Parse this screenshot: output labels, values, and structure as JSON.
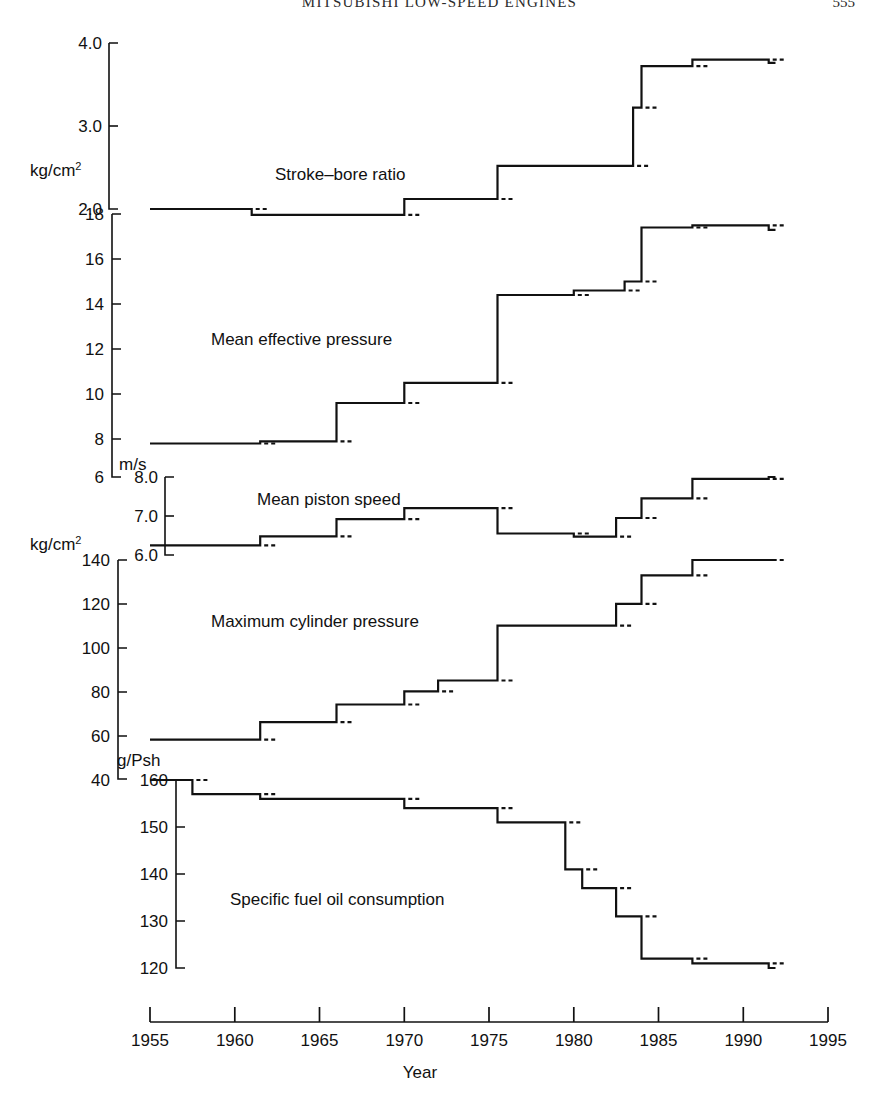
{
  "page": {
    "running_head": "MITSUBISHI LOW-SPEED ENGINES",
    "folio": "555"
  },
  "figure": {
    "x_axis": {
      "label": "Year",
      "ticks": [
        "1955",
        "1960",
        "1965",
        "1970",
        "1975",
        "1980",
        "1985",
        "1990",
        "1995"
      ],
      "min": 1955,
      "max": 1995
    },
    "series_labels": {
      "stroke_bore": "Stroke–bore ratio",
      "mep": "Mean effective pressure",
      "piston_speed": "Mean piston speed",
      "max_pressure": "Maximum cylinder pressure",
      "sfoc": "Specific fuel oil consumption"
    },
    "axis_units": {
      "stroke_bore": "kg/cm",
      "stroke_bore_sup": "2",
      "mep": "kg/cm",
      "mep_sup": "2",
      "piston_speed": "m/s",
      "max_pressure": "kg/cm",
      "max_pressure_sup": "2",
      "sfoc": "g/Psh"
    },
    "axis_ticks": {
      "stroke_bore": [
        "4.0",
        "3.0",
        "2.0"
      ],
      "mep": [
        "18",
        "16",
        "14",
        "12",
        "10",
        "8"
      ],
      "piston_speed": [
        "8.0",
        "7.0",
        "6.0"
      ],
      "max_pressure": [
        "140",
        "120",
        "100",
        "80",
        "60"
      ],
      "sfoc": [
        "160",
        "150",
        "140",
        "130",
        "120"
      ]
    }
  },
  "chart_data": {
    "type": "line",
    "xlabel": "Year",
    "ylabel": "",
    "xlim": [
      1955,
      1995
    ],
    "grid": false,
    "legend": "inline-labels",
    "note": "Five stacked step (staircase) plots sharing one Year axis; each panel has its own y-axis and units.",
    "panels": [
      {
        "name": "Stroke–bore ratio",
        "units": "(ratio)",
        "ylim": [
          2.0,
          4.0
        ],
        "yticks": [
          2.0,
          3.0,
          4.0
        ],
        "step": "post",
        "points": [
          {
            "x": 1955,
            "y": 2.0
          },
          {
            "x": 1961,
            "y": 1.93
          },
          {
            "x": 1970,
            "y": 2.12
          },
          {
            "x": 1975.5,
            "y": 2.52
          },
          {
            "x": 1983.5,
            "y": 3.22
          },
          {
            "x": 1984,
            "y": 3.72
          },
          {
            "x": 1987,
            "y": 3.8
          },
          {
            "x": 1991.5,
            "y": 3.76
          }
        ]
      },
      {
        "name": "Mean effective pressure",
        "units": "kg/cm2",
        "ylim": [
          8,
          18
        ],
        "yticks": [
          8,
          10,
          12,
          14,
          16,
          18
        ],
        "step": "post",
        "points": [
          {
            "x": 1955,
            "y": 7.8
          },
          {
            "x": 1961.5,
            "y": 7.9
          },
          {
            "x": 1966,
            "y": 9.6
          },
          {
            "x": 1970,
            "y": 10.5
          },
          {
            "x": 1975.5,
            "y": 14.4
          },
          {
            "x": 1980,
            "y": 14.6
          },
          {
            "x": 1983,
            "y": 15.0
          },
          {
            "x": 1984,
            "y": 17.4
          },
          {
            "x": 1987,
            "y": 17.5
          },
          {
            "x": 1991.5,
            "y": 17.3
          }
        ]
      },
      {
        "name": "Mean piston speed",
        "units": "m/s",
        "ylim": [
          6.0,
          8.0
        ],
        "yticks": [
          6.0,
          7.0,
          8.0
        ],
        "step": "post",
        "points": [
          {
            "x": 1955,
            "y": 6.25
          },
          {
            "x": 1961.5,
            "y": 6.48
          },
          {
            "x": 1966,
            "y": 6.92
          },
          {
            "x": 1970,
            "y": 7.2
          },
          {
            "x": 1975.5,
            "y": 6.55
          },
          {
            "x": 1980,
            "y": 6.47
          },
          {
            "x": 1982.5,
            "y": 6.95
          },
          {
            "x": 1984,
            "y": 7.45
          },
          {
            "x": 1987,
            "y": 7.95
          },
          {
            "x": 1991.5,
            "y": 8.0
          }
        ]
      },
      {
        "name": "Maximum cylinder pressure",
        "units": "kg/cm2",
        "ylim": [
          40,
          140
        ],
        "yticks": [
          40,
          60,
          80,
          100,
          120,
          140
        ],
        "step": "post",
        "points": [
          {
            "x": 1955,
            "y": 58
          },
          {
            "x": 1961.5,
            "y": 66
          },
          {
            "x": 1966,
            "y": 74
          },
          {
            "x": 1970,
            "y": 80
          },
          {
            "x": 1972,
            "y": 85
          },
          {
            "x": 1975.5,
            "y": 110
          },
          {
            "x": 1982.5,
            "y": 120
          },
          {
            "x": 1984,
            "y": 133
          },
          {
            "x": 1987,
            "y": 140
          },
          {
            "x": 1991.5,
            "y": 140
          }
        ]
      },
      {
        "name": "Specific fuel oil consumption",
        "units": "g/Psh",
        "ylim": [
          120,
          160
        ],
        "yticks": [
          120,
          130,
          140,
          150,
          160
        ],
        "step": "post",
        "points": [
          {
            "x": 1955,
            "y": 160
          },
          {
            "x": 1957.5,
            "y": 157
          },
          {
            "x": 1961.5,
            "y": 156
          },
          {
            "x": 1970,
            "y": 154
          },
          {
            "x": 1975.5,
            "y": 151
          },
          {
            "x": 1979.5,
            "y": 141
          },
          {
            "x": 1980.5,
            "y": 137
          },
          {
            "x": 1982.5,
            "y": 131
          },
          {
            "x": 1984,
            "y": 122
          },
          {
            "x": 1987,
            "y": 121
          },
          {
            "x": 1991.5,
            "y": 120
          }
        ]
      }
    ]
  }
}
